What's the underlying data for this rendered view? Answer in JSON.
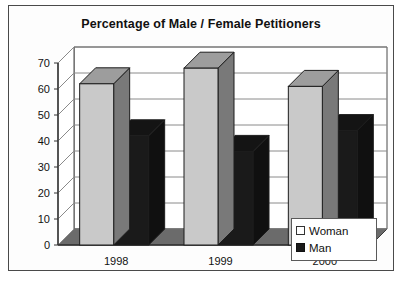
{
  "chart_data": {
    "type": "bar",
    "title": "Percentage of Male / Female Petitioners",
    "xlabel": "",
    "ylabel": "",
    "categories": [
      "1998",
      "1999",
      "2000"
    ],
    "series": [
      {
        "name": "Woman",
        "values": [
          62,
          68,
          61
        ],
        "color": "#c9c9c9"
      },
      {
        "name": "Man",
        "values": [
          42,
          36,
          44
        ],
        "color": "#1a1a1a"
      }
    ],
    "ylim": [
      0,
      70
    ],
    "yticks": [
      0,
      10,
      20,
      30,
      40,
      50,
      60,
      70
    ],
    "ytick_labels": [
      "0",
      "10",
      "20",
      "30",
      "40",
      "50",
      "60",
      "70"
    ],
    "grid": true,
    "legend_position": "bottom-right",
    "style": "3d-column",
    "floor_color": "#6b6b6b",
    "plot_background": "#ffffff",
    "gridline_color": "#8a8a8a",
    "frame_color": "#4a4a4a"
  },
  "legend": {
    "items": [
      {
        "label": "Woman",
        "swatch": "woman"
      },
      {
        "label": "Man",
        "swatch": "man"
      }
    ]
  }
}
